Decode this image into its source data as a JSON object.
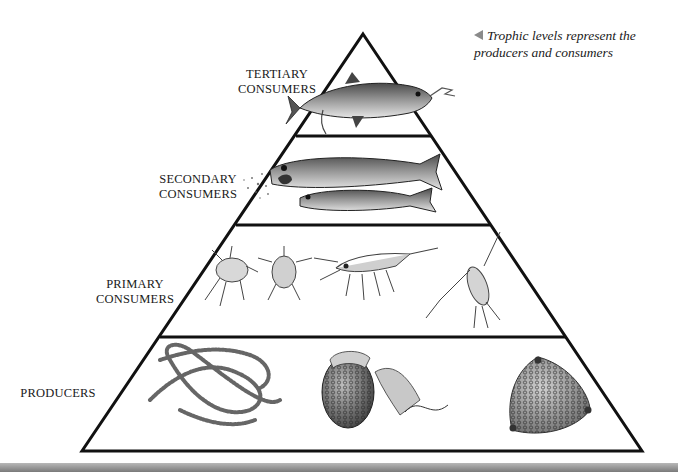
{
  "caption": {
    "icon": "triangle-left-icon",
    "text": "Trophic levels represent the producers and consumers"
  },
  "pyramid": {
    "levels": [
      {
        "label_line1": "TERTIARY",
        "label_line2": "CONSUMERS",
        "organisms": [
          "tuna-fish"
        ]
      },
      {
        "label_line1": "SECONDARY",
        "label_line2": "CONSUMERS",
        "organisms": [
          "large-fish",
          "small-fish"
        ]
      },
      {
        "label_line1": "PRIMARY",
        "label_line2": "CONSUMERS",
        "organisms": [
          "amphipod",
          "larva",
          "krill-shrimp",
          "copepod"
        ]
      },
      {
        "label_line1": "PRODUCERS",
        "label_line2": "",
        "organisms": [
          "bead-chain-algae",
          "dinoflagellate",
          "diatom"
        ]
      }
    ]
  },
  "colors": {
    "outline": "#111111",
    "caption_arrow": "#8a8a8a",
    "bottom_bar": "#9a9a9a"
  }
}
